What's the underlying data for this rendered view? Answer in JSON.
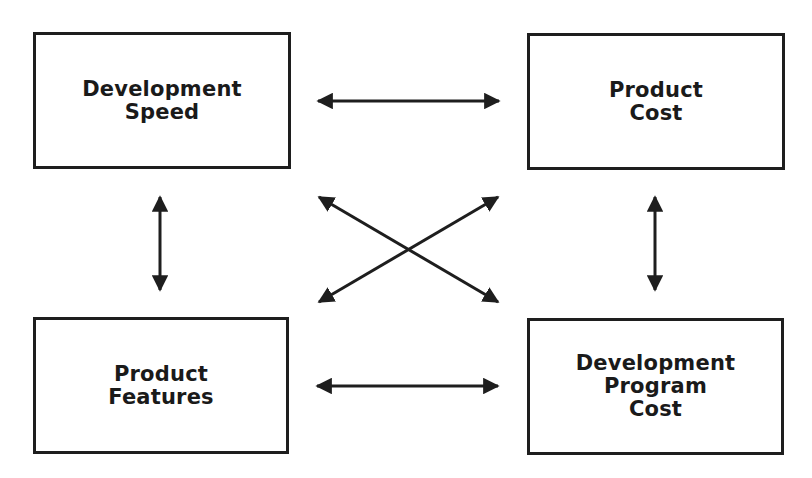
{
  "diagram": {
    "nodes": [
      {
        "id": "development-speed",
        "label": "Development\nSpeed",
        "x": 33,
        "y": 32,
        "w": 258,
        "h": 137
      },
      {
        "id": "product-cost",
        "label": "Product\nCost",
        "x": 527,
        "y": 33,
        "w": 258,
        "h": 137
      },
      {
        "id": "product-features",
        "label": "Product\nFeatures",
        "x": 33,
        "y": 317,
        "w": 256,
        "h": 137
      },
      {
        "id": "development-program-cost",
        "label": "Development\nProgram\nCost",
        "x": 527,
        "y": 318,
        "w": 257,
        "h": 137
      }
    ],
    "edges": [
      {
        "from": "development-speed",
        "to": "product-cost",
        "type": "bidirectional"
      },
      {
        "from": "product-features",
        "to": "development-program-cost",
        "type": "bidirectional"
      },
      {
        "from": "development-speed",
        "to": "product-features",
        "type": "bidirectional"
      },
      {
        "from": "product-cost",
        "to": "development-program-cost",
        "type": "bidirectional"
      },
      {
        "from": "development-speed",
        "to": "development-program-cost",
        "type": "bidirectional"
      },
      {
        "from": "product-cost",
        "to": "product-features",
        "type": "bidirectional"
      }
    ],
    "colors": {
      "stroke": "#1e1e1e",
      "background": "#ffffff"
    }
  }
}
